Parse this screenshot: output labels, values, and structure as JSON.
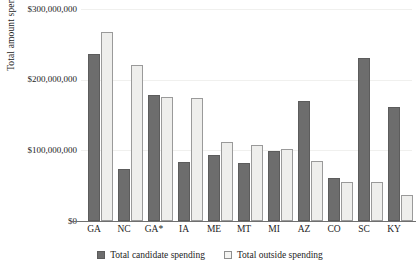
{
  "chart_data": {
    "type": "bar",
    "title": "",
    "xlabel": "",
    "ylabel": "Total amount spent",
    "ylim": [
      0,
      300000000
    ],
    "grid": true,
    "legend_position": "bottom-center",
    "categories": [
      "GA",
      "NC",
      "GA*",
      "IA",
      "ME",
      "MT",
      "MI",
      "AZ",
      "CO",
      "SC",
      "KY"
    ],
    "ytick_labels": [
      "$0",
      "$100,000,000",
      "$200,000,000",
      "$300,000,000"
    ],
    "ytick_values": [
      0,
      100000000,
      200000000,
      300000000
    ],
    "series": [
      {
        "name": "Total candidate spending",
        "color": "#6d6d6d",
        "values": [
          236000000,
          73000000,
          179000000,
          84000000,
          93000000,
          82000000,
          99000000,
          170000000,
          61000000,
          230000000,
          161000000
        ]
      },
      {
        "name": "Total outside spending",
        "color": "#eeeeec",
        "values": [
          268000000,
          221000000,
          176000000,
          174000000,
          112000000,
          108000000,
          102000000,
          85000000,
          55000000,
          55000000,
          37000000
        ]
      }
    ]
  }
}
